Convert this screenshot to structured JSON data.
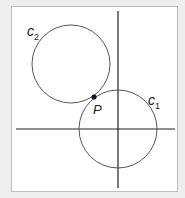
{
  "diagram": {
    "labels": {
      "c2": "c",
      "c2_sub": "2",
      "c1": "c",
      "c1_sub": "1",
      "p": "P"
    },
    "axes": {
      "origin": [
        118,
        129
      ],
      "x_range": [
        16,
        175
      ],
      "y_range": [
        11,
        188
      ]
    },
    "circles": [
      {
        "name": "c1",
        "cx": 118,
        "cy": 129,
        "r": 39
      },
      {
        "name": "c2",
        "cx": 71,
        "cy": 64,
        "r": 39
      }
    ],
    "point": {
      "name": "P",
      "x": 94,
      "y": 97
    },
    "colors": {
      "stroke": "#555555",
      "axis": "#222222",
      "point": "#111111",
      "background": "#eeeeee",
      "frame": "#ffffff"
    }
  }
}
